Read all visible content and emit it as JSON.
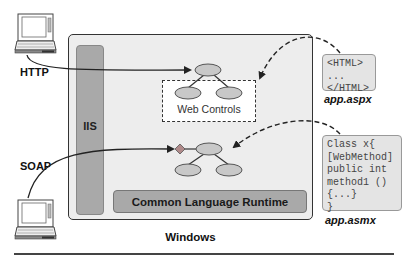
{
  "diagram": {
    "clients": [
      {
        "id": "http-client",
        "protocol": "HTTP",
        "icon": "laptop-icon"
      },
      {
        "id": "soap-client",
        "protocol": "SOAP",
        "icon": "laptop-icon"
      }
    ],
    "container": {
      "label": "Windows"
    },
    "iis": {
      "label": "IIS"
    },
    "runtime": {
      "label": "Common Language Runtime"
    },
    "web_controls": {
      "label": "Web Controls"
    },
    "files": {
      "aspx": {
        "label": "app.aspx",
        "code_lines": [
          "<HTML>",
          "...",
          "</HTML>"
        ]
      },
      "asmx": {
        "label": "app.asmx",
        "code_lines": [
          "Class x{",
          "[WebMethod]",
          "public int",
          "method1 ()",
          "{...}",
          "}"
        ]
      }
    },
    "edges": [
      {
        "from": "HTTP",
        "to": "web-controls-tree",
        "style": "solid"
      },
      {
        "from": "SOAP",
        "to": "web-service-tree",
        "style": "solid"
      },
      {
        "from": "app.aspx",
        "to": "Web Controls",
        "style": "dashed"
      },
      {
        "from": "app.asmx",
        "to": "web-service-tree",
        "style": "dashed"
      }
    ],
    "colors": {
      "container_fill": "#ededed",
      "bar_fill": "#a9a9a9",
      "node_fill": "#c8c8c8",
      "diamond_fill": "#b08a8a"
    }
  }
}
